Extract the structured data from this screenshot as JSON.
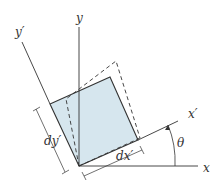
{
  "diagram": {
    "labels": {
      "y": "y",
      "y_prime": "y′",
      "x": "x",
      "x_prime": "x′",
      "theta": "θ",
      "dx_prime": "dx′",
      "dy_prime": "dy′"
    },
    "colors": {
      "fill": "#d6e6ee",
      "line": "#333333"
    }
  }
}
